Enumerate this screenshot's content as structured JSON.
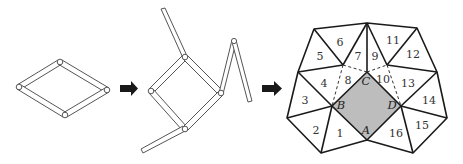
{
  "figure": {
    "arrows": [
      {
        "name": "arrow-1",
        "icon": "right-arrow-icon"
      },
      {
        "name": "arrow-2",
        "icon": "right-arrow-icon"
      }
    ],
    "vertex_labels": {
      "A": "A",
      "B": "B",
      "C": "C",
      "D": "D"
    },
    "triangle_labels": [
      "1",
      "2",
      "3",
      "4",
      "5",
      "6",
      "7",
      "8",
      "9",
      "10",
      "11",
      "12",
      "13",
      "14",
      "15",
      "16"
    ],
    "colors": {
      "shaded_square": "#bdbdbd",
      "lines": "#1a1a1a",
      "background": "#ffffff"
    }
  }
}
